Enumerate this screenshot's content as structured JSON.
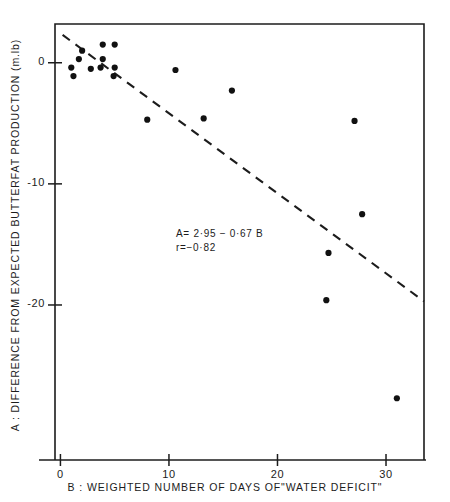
{
  "chart_data": {
    "type": "scatter",
    "title": "",
    "xlabel": "B : WEIGHTED  NUMBER  OF  DAYS  OF\"WATER  DEFICIT\"",
    "ylabel": "A : DIFFERENCE  FROM  EXPECTED  BUTTERFAT  PRODUCTION (m.lb)",
    "xlim": [
      -0.5,
      33.5
    ],
    "ylim": [
      -32.8,
      3.2
    ],
    "xticks": [
      0,
      10,
      20,
      30
    ],
    "xticklabels": [
      "0",
      "10",
      "20",
      "30"
    ],
    "yticks": [
      0,
      -10,
      -20
    ],
    "yticklabels": [
      "0",
      "-10",
      "-20"
    ],
    "grid": false,
    "legend": null,
    "points": [
      {
        "x": 1.2,
        "y": -1.1
      },
      {
        "x": 2.0,
        "y": 1.0
      },
      {
        "x": 1.7,
        "y": 0.3
      },
      {
        "x": 1.0,
        "y": -0.4
      },
      {
        "x": 2.8,
        "y": -0.5
      },
      {
        "x": 3.9,
        "y": 1.5
      },
      {
        "x": 5.0,
        "y": 1.5
      },
      {
        "x": 3.9,
        "y": 0.3
      },
      {
        "x": 3.7,
        "y": -0.4
      },
      {
        "x": 5.0,
        "y": -0.4
      },
      {
        "x": 4.9,
        "y": -1.1
      },
      {
        "x": 10.6,
        "y": -0.6
      },
      {
        "x": 8.0,
        "y": -4.7
      },
      {
        "x": 13.2,
        "y": -4.6
      },
      {
        "x": 15.8,
        "y": -2.3
      },
      {
        "x": 27.1,
        "y": -4.8
      },
      {
        "x": 27.8,
        "y": -12.5
      },
      {
        "x": 24.7,
        "y": -15.7
      },
      {
        "x": 24.5,
        "y": -19.6
      },
      {
        "x": 31.0,
        "y": -27.7
      }
    ],
    "fit_line": {
      "style": "dashed",
      "equation": "A = 2·95 − 0·67 B",
      "intercept": 2.95,
      "slope": -0.67,
      "x_start": 0.2,
      "x_end": 33.5,
      "y_start": 2.3,
      "y_end": -19.7
    },
    "annotations": {
      "equation": "A= 2·95 − 0·67 B",
      "correlation": "r=−0·82"
    }
  },
  "axes": {
    "frame": {
      "left": 55,
      "right": 424,
      "top": 24,
      "bottom": 460
    }
  }
}
